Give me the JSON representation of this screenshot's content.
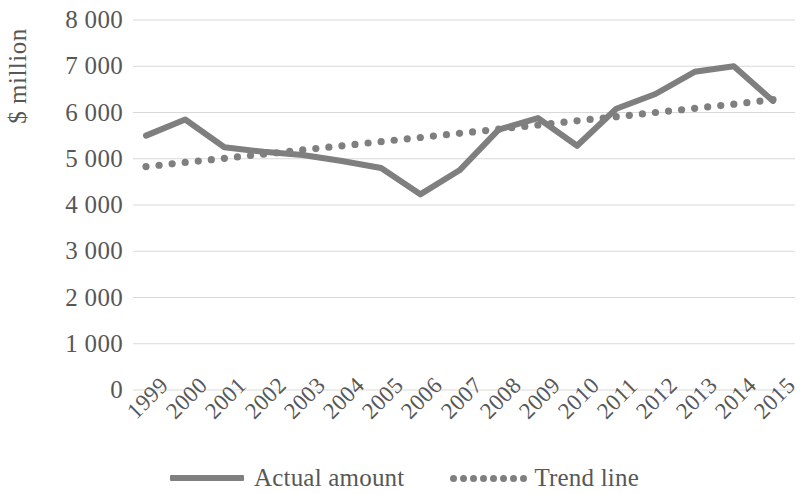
{
  "chart_data": {
    "type": "line",
    "title": "",
    "xlabel": "",
    "ylabel": "$ million",
    "categories": [
      "1999",
      "2000",
      "2001",
      "2002",
      "2003",
      "2004",
      "2005",
      "2006",
      "2007",
      "2008",
      "2009",
      "2010",
      "2011",
      "2012",
      "2013",
      "2014",
      "2015"
    ],
    "series": [
      {
        "name": "Actual amount",
        "style": "solid",
        "color": "#7f7f7f",
        "values": [
          5500,
          5850,
          5250,
          5150,
          5080,
          4950,
          4800,
          4230,
          4750,
          5630,
          5880,
          5280,
          6080,
          6400,
          6880,
          7000,
          6250
        ]
      },
      {
        "name": "Trend line",
        "style": "dotted",
        "color": "#7f7f7f",
        "values": [
          4830,
          4920,
          5010,
          5100,
          5190,
          5280,
          5370,
          5460,
          5550,
          5640,
          5730,
          5820,
          5910,
          6000,
          6090,
          6180,
          6280
        ]
      }
    ],
    "ylim": [
      0,
      8000
    ],
    "ytick_values": [
      8000,
      7000,
      6000,
      5000,
      4000,
      3000,
      2000,
      1000,
      0
    ],
    "ytick_labels": [
      "8 000",
      "7 000",
      "6 000",
      "5 000",
      "4 000",
      "3 000",
      "2 000",
      "1 000",
      "0"
    ],
    "grid": true,
    "grid_color": "#d9d9d9",
    "legend_position": "bottom",
    "legend": [
      {
        "label": "Actual amount",
        "style": "solid"
      },
      {
        "label": "Trend line",
        "style": "dotted"
      }
    ],
    "background": "#ffffff"
  }
}
